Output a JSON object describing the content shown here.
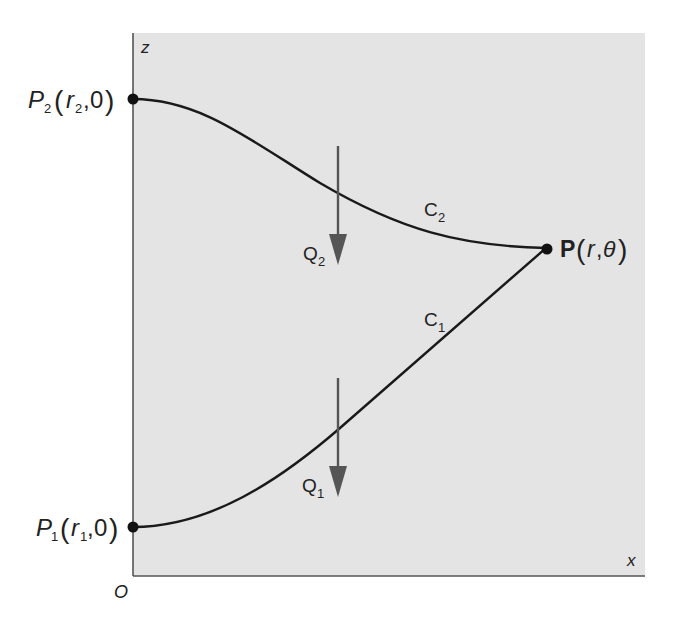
{
  "diagram": {
    "type": "two-curve path diagram",
    "background_color": "#e4e4e4",
    "axes": {
      "z_label": "z",
      "x_label": "x",
      "origin_label": "O"
    },
    "points": {
      "p2": {
        "name": "P",
        "subscript": "2",
        "coord_var": "r",
        "coord_sub": "2",
        "coord_second": "0"
      },
      "p1": {
        "name": "P",
        "subscript": "1",
        "coord_var": "r",
        "coord_sub": "1",
        "coord_second": "0"
      },
      "p": {
        "name": "P",
        "coord_var": "r",
        "coord_second": "θ"
      }
    },
    "curves": {
      "c2": {
        "name": "C",
        "subscript": "2"
      },
      "c1": {
        "name": "C",
        "subscript": "1"
      }
    },
    "arrows": {
      "q2": {
        "name": "Q",
        "subscript": "2",
        "direction": "down"
      },
      "q1": {
        "name": "Q",
        "subscript": "1",
        "direction": "down"
      }
    },
    "punct": {
      "open": "(",
      "close": ")",
      "comma": ","
    }
  }
}
